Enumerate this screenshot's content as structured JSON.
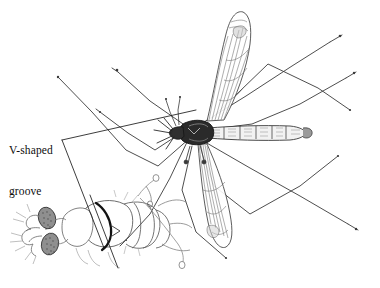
{
  "figure": {
    "kind": "scientific-line-illustration",
    "background_color": "#ffffff",
    "ink_color": "#1a1a1a",
    "width": 380,
    "height": 288
  },
  "annotation": {
    "label_line_1": "V-shaped",
    "label_line_2": "groove",
    "leader_kind": "two-line wedge pointing from label to thorax groove",
    "leader_apex": "62,140"
  },
  "main_specimen": {
    "name": "crane-fly-dorsal-view",
    "parts": [
      {
        "name": "head",
        "label": "head"
      },
      {
        "name": "thorax",
        "label": "thorax"
      },
      {
        "name": "abdomen",
        "label": "abdomen"
      },
      {
        "name": "wing-upper",
        "label": "upper wing"
      },
      {
        "name": "wing-lower",
        "label": "lower wing"
      },
      {
        "name": "legs",
        "label": "legs",
        "count": 6
      },
      {
        "name": "halteres",
        "label": "halteres"
      },
      {
        "name": "antennae",
        "label": "antennae"
      }
    ]
  },
  "detail_inset": {
    "name": "head-thorax-detail",
    "parts": [
      {
        "name": "compound-eye-upper",
        "label": "compound eye"
      },
      {
        "name": "compound-eye-lower",
        "label": "compound eye"
      },
      {
        "name": "antenna-segments",
        "label": "antenna"
      },
      {
        "name": "palps",
        "label": "palps"
      },
      {
        "name": "v-shaped-groove",
        "label": "V-shaped groove"
      },
      {
        "name": "thorax-plate",
        "label": "thorax"
      },
      {
        "name": "wing-base",
        "label": "wing base"
      }
    ]
  },
  "colors": {
    "ink": "#1a1a1a",
    "ink_light": "#555555",
    "ink_faint": "#888888",
    "stipple": "#6b6b6b",
    "background": "#ffffff"
  }
}
